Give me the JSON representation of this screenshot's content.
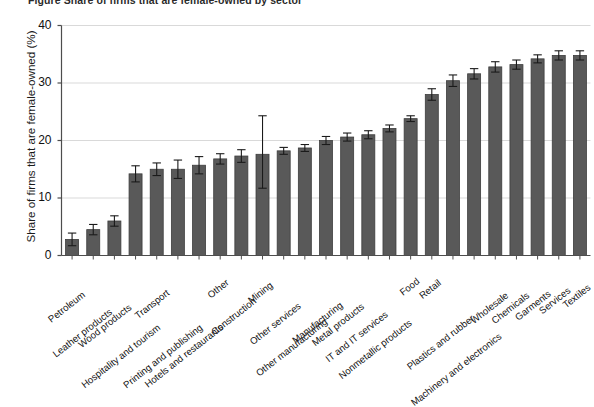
{
  "figure": {
    "title_partial": "Figure  Share of firms that are female-owned by sector",
    "ylabel": "Share of firms that are female-owned (%)"
  },
  "style": {
    "bar_color": "#595959",
    "bar_edge_color": "#3d3d3d",
    "error_bar_color": "#1a1a1a",
    "grid_color": "#d9d9d9",
    "axis_color": "#4d4d4d",
    "background": "#ffffff",
    "text_color": "#111111"
  },
  "chart_data": {
    "type": "bar",
    "title": "Share of firms that are female-owned by sector",
    "xlabel": "",
    "ylabel": "Share of firms that are female-owned (%)",
    "ylim": [
      0,
      40
    ],
    "yticks": [
      0,
      10,
      20,
      30,
      40
    ],
    "ytick_labels": [
      "0",
      "10",
      "20",
      "30",
      "40"
    ],
    "grid": "horizontal",
    "legend": "none",
    "error_bars": "95% confidence interval",
    "categories": [
      "Petroleum",
      "Leather products",
      "Wood products",
      "Hospitality and tourism",
      "Transport",
      "Printing and publishing",
      "Hotels and restaurants",
      "Other",
      "Construction",
      "Mining",
      "Other services",
      "Other manufacturing",
      "Manufacturing",
      "Metal products",
      "IT and IT services",
      "Nonmetallic products",
      "Food",
      "Retail",
      "Plastics and rubber",
      "Machinery and electronics",
      "Wholesale",
      "Chemicals",
      "Garments",
      "Services",
      "Textiles"
    ],
    "values": [
      2.8,
      4.5,
      6.0,
      14.2,
      15.0,
      15.0,
      15.7,
      16.8,
      17.3,
      17.6,
      18.2,
      18.7,
      20.0,
      20.6,
      21.0,
      22.1,
      23.8,
      28.0,
      30.4,
      31.6,
      32.8,
      33.2,
      34.2,
      34.8,
      34.8
    ],
    "err_low": [
      1.7,
      3.6,
      5.1,
      12.8,
      13.9,
      13.4,
      14.2,
      15.9,
      16.2,
      11.7,
      17.6,
      18.1,
      19.3,
      19.9,
      20.3,
      21.5,
      23.3,
      27.0,
      29.4,
      30.7,
      31.9,
      32.4,
      33.5,
      34.0,
      34.0
    ],
    "err_high": [
      3.9,
      5.4,
      6.9,
      15.6,
      16.1,
      16.6,
      17.2,
      17.7,
      18.4,
      24.3,
      18.8,
      19.3,
      20.7,
      21.3,
      21.7,
      22.7,
      24.3,
      29.0,
      31.4,
      32.5,
      33.7,
      34.0,
      34.9,
      35.6,
      35.6
    ]
  }
}
